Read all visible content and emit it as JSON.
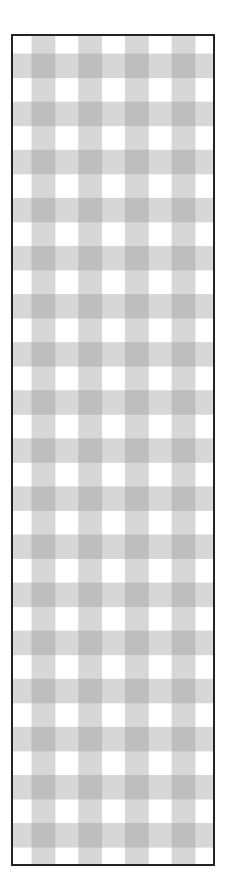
{
  "pattern": {
    "name": "gingham-check",
    "description": "Gray and white gingham checkered pattern inside a thin dark border",
    "colors": {
      "background": "#ffffff",
      "stripe": "#d8d8d8",
      "intersection": "#b4b4b4",
      "border": "#222222"
    },
    "column_period_px": 46.7,
    "row_period_px": 48.1,
    "columns_gray_count": 4,
    "rows_gray_count": 17
  }
}
